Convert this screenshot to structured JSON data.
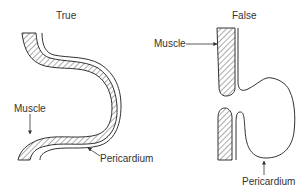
{
  "panels": [
    {
      "title": "True",
      "labels": {
        "muscle": "Muscle",
        "pericardium": "Pericardium"
      }
    },
    {
      "title": "False",
      "labels": {
        "muscle": "Muscle",
        "pericardium": "Pericardium"
      }
    }
  ]
}
